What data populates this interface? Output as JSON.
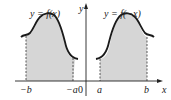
{
  "figure": {
    "left_curve_label": "y = f(x)",
    "right_curve_label": "y = f(−x)",
    "axis_x_label": "x",
    "axis_y_label": "y",
    "origin_label": "0",
    "ticks": {
      "neg_b": "−b",
      "neg_a": "−a",
      "a": "a",
      "b": "b"
    },
    "colors": {
      "curve": "#1a1a1a",
      "shade": "#d6d6d6",
      "axis": "#222222"
    }
  }
}
